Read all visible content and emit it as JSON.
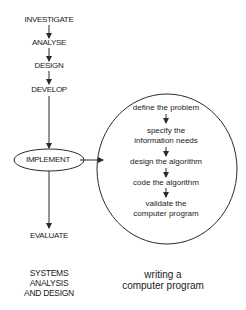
{
  "left_process": {
    "steps": [
      "INVESTIGATE",
      "ANALYSE",
      "DESIGN",
      "DEVELOP",
      "IMPLEMENT",
      "EVALUATE"
    ],
    "caption": [
      "SYSTEMS",
      "ANALYSIS",
      "AND DESIGN"
    ]
  },
  "right_process": {
    "steps": [
      "define the problem",
      "specify the",
      "information needs",
      "design the algorithm",
      "code the algorithm",
      "validate the",
      "computer program"
    ],
    "caption": [
      "writing a",
      "computer program"
    ]
  },
  "colors": {
    "line": "#2a2a2a",
    "text": "#1a1a1a"
  }
}
